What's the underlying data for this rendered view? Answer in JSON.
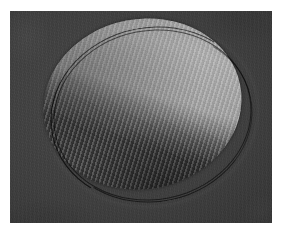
{
  "image": {
    "kind": "grayscale-micrograph",
    "width": 282,
    "height": 236,
    "border_color": "#ffffff",
    "border_px": 10,
    "plate": {
      "x": 10,
      "y": 11,
      "width": 262,
      "height": 212,
      "background_color": "#3d3d3d",
      "texture": "fine-grain-noise"
    },
    "subject": {
      "name": "elliptical-particle",
      "shape": "ellipse",
      "x": 43,
      "y": 19,
      "width": 199,
      "height": 170,
      "rotation_deg": -11,
      "fill_color": "#454545",
      "rim_color": "#0d0d0d",
      "fringes": {
        "type": "diagonal-lattice-fringes",
        "angle_deg": 118,
        "spacing_px": 4.4,
        "light_color": "#8e8e8e",
        "dark_color": "#2b2b2b"
      },
      "bright_band": {
        "name": "illuminated-band",
        "angle_deg": 28,
        "peak_color": "#a8a8a8",
        "coverage": "right-central third of the ellipse"
      }
    }
  },
  "labels": {
    "figure_title": "",
    "caption": "",
    "scale_bar": ""
  }
}
